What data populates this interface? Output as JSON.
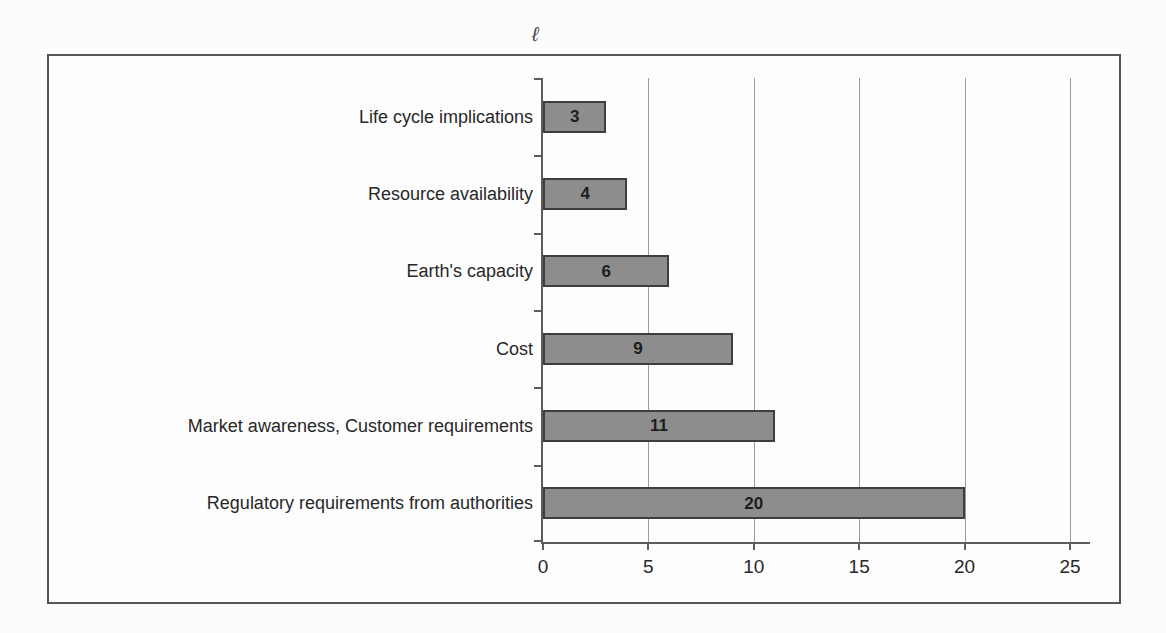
{
  "figure": {
    "stray_mark": "ℓ"
  },
  "chart_data": {
    "type": "bar",
    "orientation": "horizontal",
    "title": "",
    "xlabel": "",
    "ylabel": "",
    "categories": [
      "Life cycle implications",
      "Resource availability",
      "Earth's capacity",
      "Cost",
      "Market awareness, Customer requirements",
      "Regulatory requirements from authorities"
    ],
    "values": [
      3,
      4,
      6,
      9,
      11,
      20
    ],
    "data_labels": [
      "3",
      "4",
      "6",
      "9",
      "11",
      "20"
    ],
    "xlim": [
      0,
      25
    ],
    "xticks": [
      0,
      5,
      10,
      15,
      20,
      25
    ],
    "grid": "vertical",
    "legend": "none",
    "colors": {
      "bar_fill": "#8d8d8d",
      "bar_border": "#3e3e3e",
      "gridline": "#9c9c9c",
      "axis": "#5c5c5c",
      "text": "#282828",
      "frame_border": "#565656",
      "background": "#fcfcfc"
    }
  }
}
